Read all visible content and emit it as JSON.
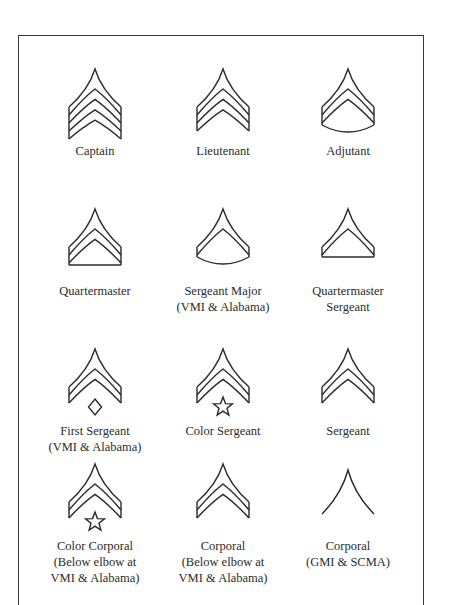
{
  "figure": {
    "title": "",
    "ink_color": "#2a2a2a",
    "rows": [
      [
        {
          "id": "captain",
          "chevrons": 3,
          "bars": "open-bottom",
          "base": "none",
          "device": "none",
          "label_lines": [
            "Captain"
          ]
        },
        {
          "id": "lieutenant",
          "chevrons": 2,
          "bars": "open-bottom",
          "base": "none",
          "device": "none",
          "label_lines": [
            "Lieutenant"
          ]
        },
        {
          "id": "adjutant",
          "chevrons": 2,
          "bars": "open-bottom",
          "base": "arc",
          "device": "none",
          "label_lines": [
            "Adjutant"
          ]
        }
      ],
      [
        {
          "id": "quartermaster",
          "chevrons": 2,
          "bars": "closed",
          "base": "straight",
          "device": "none",
          "label_lines": [
            "Quartermaster"
          ]
        },
        {
          "id": "sergeant-major",
          "chevrons": 1,
          "bars": "closed",
          "base": "arc",
          "device": "none",
          "label_lines": [
            "Sergeant Major",
            "(VMI & Alabama)"
          ]
        },
        {
          "id": "quartermaster-sergeant",
          "chevrons": 1,
          "bars": "closed",
          "base": "straight",
          "device": "none",
          "label_lines": [
            "Quartermaster",
            "Sergeant"
          ]
        }
      ],
      [
        {
          "id": "first-sergeant",
          "chevrons": 1,
          "bars": "open-bottom",
          "base": "none",
          "device": "diamond",
          "label_lines": [
            "First Sergeant",
            "(VMI & Alabama)"
          ]
        },
        {
          "id": "color-sergeant",
          "chevrons": 1,
          "bars": "open-bottom",
          "base": "none",
          "device": "star",
          "label_lines": [
            "Color Sergeant"
          ]
        },
        {
          "id": "sergeant",
          "chevrons": 1,
          "bars": "open-bottom",
          "base": "none",
          "device": "none",
          "label_lines": [
            "Sergeant"
          ]
        }
      ],
      [
        {
          "id": "color-corporal",
          "chevrons": 1,
          "bars": "open-bottom",
          "base": "none",
          "device": "star",
          "label_lines": [
            "Color Corporal",
            "(Below elbow at",
            "VMI & Alabama)"
          ]
        },
        {
          "id": "corporal-vmi",
          "chevrons": 1,
          "bars": "open-bottom",
          "base": "none",
          "device": "none",
          "label_lines": [
            "Corporal",
            "(Below elbow at",
            "VMI & Alabama)"
          ]
        },
        {
          "id": "corporal-gmi",
          "chevrons": 0,
          "bars": "single-line",
          "base": "none",
          "device": "none",
          "label_lines": [
            "Corporal",
            "(GMI & SCMA)"
          ]
        }
      ]
    ]
  }
}
